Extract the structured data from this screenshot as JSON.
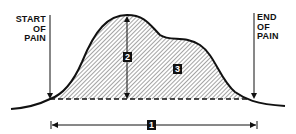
{
  "labels": {
    "start": [
      "START",
      "OF",
      "PAIN"
    ],
    "end": [
      "END",
      "OF",
      "PAIN"
    ]
  },
  "badges": {
    "duration": "1",
    "peak_intensity": "2",
    "area": "3"
  },
  "colors": {
    "line": "#111111",
    "hatch": "#555555",
    "background": "#ffffff"
  }
}
